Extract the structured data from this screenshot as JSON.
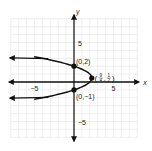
{
  "chart_data": {
    "type": "line",
    "title": "",
    "xlabel": "x",
    "ylabel": "y",
    "xlim": [
      -8,
      8
    ],
    "ylim": [
      -7,
      8
    ],
    "grid": true,
    "x_tick_labels": [
      {
        "value": -5,
        "label": "−5"
      },
      {
        "value": 5,
        "label": "5"
      }
    ],
    "y_tick_labels": [
      {
        "value": 5,
        "label": "5"
      },
      {
        "value": -5,
        "label": "−5"
      }
    ],
    "series": [
      {
        "name": "x = -y^2 + y + 2",
        "equation": "x = -(y - 2)(y + 1)",
        "y_range": [
          -2.2,
          3.2
        ],
        "color": "#111111"
      }
    ],
    "points": [
      {
        "x": 0,
        "y": 2,
        "label": "(0,2)"
      },
      {
        "x": 2.25,
        "y": 0.5,
        "label": "(9/4, 1/2)",
        "num_x": "9",
        "den_x": "4",
        "num_y": "1",
        "den_y": "2"
      },
      {
        "x": 0,
        "y": -1,
        "label": "(0,−1)"
      }
    ],
    "colors": {
      "grid": "#e2e2e2",
      "axis": "#111111",
      "curve": "#111111"
    }
  }
}
